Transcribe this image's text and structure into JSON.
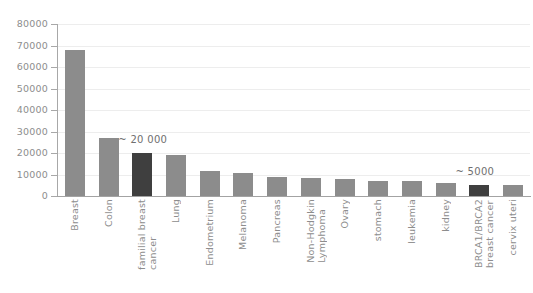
{
  "chart_data": {
    "type": "bar",
    "title": "",
    "subtitle": "",
    "xlabel": "",
    "ylabel": "",
    "ylim": [
      0,
      80000
    ],
    "ytick_step": 10000,
    "yticks": [
      80000,
      70000,
      60000,
      50000,
      40000,
      30000,
      20000,
      10000,
      0
    ],
    "ytick_labels": [
      "80000",
      "70000",
      "60000",
      "50000",
      "40000",
      "30000",
      "20000",
      "10000",
      "0"
    ],
    "grid": true,
    "legend": "none",
    "categories": [
      "Breast",
      "Colon",
      "familial breast\ncancer",
      "Lung",
      "Endometrium",
      "Melanoma",
      "Pancreas",
      "Non-Hodgkin\nLymphoma",
      "Ovary",
      "stomach",
      "leukemia",
      "kidney",
      "BRCA1/BRCA2\nbreast cancer",
      "cervix uteri"
    ],
    "values": [
      68000,
      27000,
      20000,
      19000,
      11500,
      10500,
      9000,
      8500,
      7800,
      7000,
      7200,
      6000,
      5000,
      5200
    ],
    "bar_colors": [
      "#8c8c8c",
      "#8c8c8c",
      "#3f3f3f",
      "#8c8c8c",
      "#8c8c8c",
      "#8c8c8c",
      "#8c8c8c",
      "#8c8c8c",
      "#8c8c8c",
      "#8c8c8c",
      "#8c8c8c",
      "#8c8c8c",
      "#3f3f3f",
      "#8c8c8c"
    ],
    "highlight_color": "#3f3f3f",
    "default_color": "#8c8c8c",
    "grid_color": "#ededed",
    "axis_color": "#a3a3a3",
    "text_color": "#8d8d8d",
    "annotations": [
      {
        "text": "~ 20 000",
        "category": "familial breast\ncancer",
        "value": 20000
      },
      {
        "text": "~ 5000",
        "category": "BRCA1/BRCA2\nbreast cancer",
        "value": 5000
      }
    ]
  },
  "annotation_labels": {
    "familial": "~ 20 000",
    "brca": "~ 5000"
  }
}
